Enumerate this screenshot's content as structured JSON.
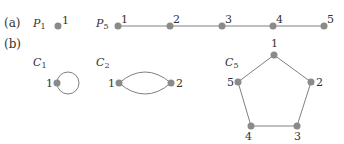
{
  "panels": {
    "a": {
      "tag": "(a)"
    },
    "b": {
      "tag": "(b)"
    }
  },
  "graphs": {
    "P1": {
      "name": "P",
      "sub": "1",
      "nodes": [
        "1"
      ]
    },
    "P5": {
      "name": "P",
      "sub": "5",
      "nodes": [
        "1",
        "2",
        "3",
        "4",
        "5"
      ]
    },
    "C1": {
      "name": "C",
      "sub": "1",
      "nodes": [
        "1"
      ]
    },
    "C2": {
      "name": "C",
      "sub": "2",
      "nodes": [
        "1",
        "2"
      ]
    },
    "C5": {
      "name": "C",
      "sub": "5",
      "nodes": [
        "1",
        "2",
        "3",
        "4",
        "5"
      ]
    }
  },
  "colors": {
    "node": "#8a8a8a",
    "edge": "#808080",
    "text": "#333333"
  }
}
